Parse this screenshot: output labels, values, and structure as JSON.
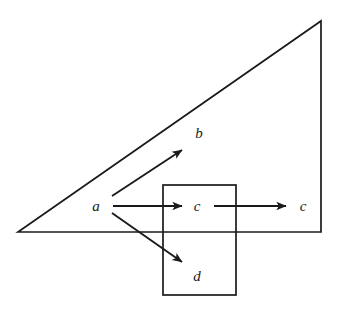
{
  "figure": {
    "canvas": {
      "width": 339,
      "height": 313
    },
    "background_color": "#ffffff",
    "stroke_color": "#1a1a1a",
    "shapes": [
      {
        "name": "triangle",
        "type": "polygon",
        "points": "18,232 321,21 321,232"
      },
      {
        "name": "rectangle",
        "type": "rect",
        "x": 163,
        "y": 185,
        "width": 73,
        "height": 110
      }
    ],
    "arrows": [
      {
        "name": "arrow-a-to-b",
        "from": "a",
        "to": "b",
        "x1": 112,
        "y1": 196,
        "x2": 182,
        "y2": 150
      },
      {
        "name": "arrow-a-to-c",
        "from": "a",
        "to": "c",
        "x1": 113,
        "y1": 206,
        "x2": 182,
        "y2": 206
      },
      {
        "name": "arrow-a-to-d",
        "from": "a",
        "to": "d",
        "x1": 112,
        "y1": 213,
        "x2": 182,
        "y2": 262
      },
      {
        "name": "arrow-c-to-c",
        "from": "c",
        "to": "c",
        "x1": 214,
        "y1": 206,
        "x2": 286,
        "y2": 206
      }
    ],
    "labels": [
      {
        "name": "label-a",
        "text": "a",
        "x": 96,
        "y": 206
      },
      {
        "name": "label-b",
        "text": "b",
        "x": 199,
        "y": 133
      },
      {
        "name": "label-c-inner",
        "text": "c",
        "x": 197,
        "y": 206
      },
      {
        "name": "label-c-outer",
        "text": "c",
        "x": 303,
        "y": 206
      },
      {
        "name": "label-d",
        "text": "d",
        "x": 197,
        "y": 276
      }
    ]
  }
}
